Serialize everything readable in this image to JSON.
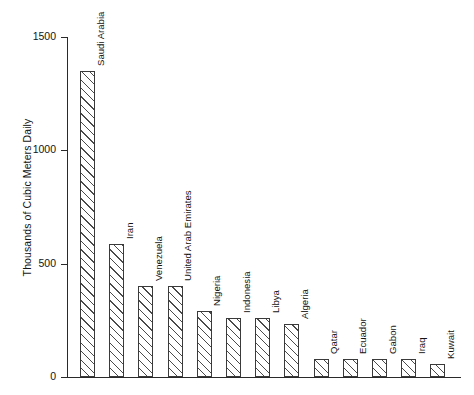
{
  "chart_data": {
    "type": "bar",
    "title": "",
    "xlabel": "",
    "ylabel": "Thousands of Cubic Meters Daily",
    "ylim": [
      0,
      1500
    ],
    "yticks": [
      0,
      500,
      1000,
      1500
    ],
    "ytick_labels": [
      "0",
      "500",
      "1000",
      "1500"
    ],
    "grid": false,
    "legend": null,
    "orientation": "vertical",
    "bar_style": "diagonal-hatch-outline",
    "categories": [
      "Saudi Arabia",
      "Iran",
      "Venezuela",
      "United Arab Emirates",
      "Nigeria",
      "Indonesia",
      "Libya",
      "Algeria",
      "Qatar",
      "Ecuador",
      "Gabon",
      "Iraq",
      "Kuwait"
    ],
    "values": [
      1350,
      585,
      400,
      400,
      290,
      260,
      260,
      235,
      80,
      80,
      80,
      80,
      58
    ]
  },
  "axis": {
    "y_title": "Thousands of Cubic Meters Daily",
    "tick_0": "0",
    "tick_500": "500",
    "tick_1000": "1000",
    "tick_1500": "1500"
  },
  "bar_labels": {
    "b0": "Saudi Arabia",
    "b1": "Iran",
    "b2": "Venezuela",
    "b3": "United Arab Emirates",
    "b4": "Nigeria",
    "b5": "Indonesia",
    "b6": "Libya",
    "b7": "Algeria",
    "b8": "Qatar",
    "b9": "Ecuador",
    "b10": "Gabon",
    "b11": "Iraq",
    "b12": "Kuwait"
  }
}
